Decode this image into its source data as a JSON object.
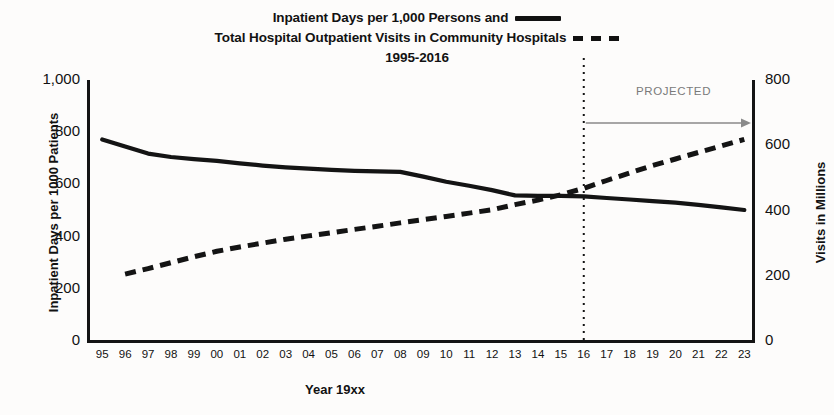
{
  "chart_data": {
    "type": "line",
    "title": "Inpatient Days per 1,000 Persons and Total Hospital Outpatient Visits in Community Hospitals 1995-2016",
    "title_lines": [
      "Inpatient Days per 1,000 Persons and",
      "Total Hospital Outpatient Visits in Community Hospitals",
      "1995-2016"
    ],
    "xlabel": "Year 19xx",
    "ylabel": "Inpatient Days per 1000 Patients",
    "y2label": "Visits in Millions",
    "ylim": [
      0,
      1000
    ],
    "y2lim": [
      0,
      800
    ],
    "yticks": [
      "0",
      "200",
      "400",
      "600",
      "800",
      "1,000"
    ],
    "y2ticks": [
      "0",
      "200",
      "400",
      "600",
      "800"
    ],
    "grid": false,
    "legend_position": "title",
    "categories": [
      "95",
      "96",
      "97",
      "98",
      "99",
      "00",
      "01",
      "02",
      "03",
      "04",
      "05",
      "06",
      "07",
      "08",
      "09",
      "10",
      "11",
      "12",
      "13",
      "14",
      "15",
      "16",
      "17",
      "18",
      "19",
      "20",
      "21",
      "22",
      "23"
    ],
    "annotation": "PROJECTED",
    "projection_divider_category": "16",
    "series": [
      {
        "name": "Inpatient Days per 1,000 Persons",
        "style": "solid",
        "axis": "left",
        "color": "#141414",
        "x": [
          "95",
          "96",
          "97",
          "98",
          "99",
          "00",
          "01",
          "02",
          "03",
          "04",
          "05",
          "06",
          "07",
          "08",
          "09",
          "10",
          "11",
          "12",
          "13",
          "14",
          "15",
          "16",
          "17",
          "18",
          "19",
          "20",
          "21",
          "22",
          "23"
        ],
        "values": [
          772,
          745,
          718,
          705,
          697,
          690,
          681,
          672,
          665,
          660,
          656,
          652,
          650,
          648,
          630,
          610,
          595,
          578,
          558,
          556,
          556,
          554,
          548,
          542,
          536,
          530,
          522,
          512,
          502
        ]
      },
      {
        "name": "Total Hospital Outpatient Visits in Community Hospitals",
        "style": "dashed",
        "axis": "right",
        "color": "#141414",
        "x": [
          "96",
          "97",
          "98",
          "99",
          "00",
          "01",
          "02",
          "03",
          "04",
          "05",
          "06",
          "07",
          "08",
          "09",
          "10",
          "11",
          "12",
          "13",
          "14",
          "15",
          "16",
          "17",
          "18",
          "19",
          "20",
          "21",
          "22",
          "23"
        ],
        "values": [
          205,
          222,
          240,
          258,
          275,
          288,
          300,
          312,
          322,
          332,
          342,
          352,
          362,
          372,
          382,
          392,
          402,
          418,
          432,
          448,
          468,
          492,
          515,
          538,
          558,
          578,
          598,
          618
        ]
      }
    ]
  },
  "colors": {
    "ink": "#141414",
    "projection_gray": "#7a7a7a",
    "background": "#fdfcfb"
  }
}
